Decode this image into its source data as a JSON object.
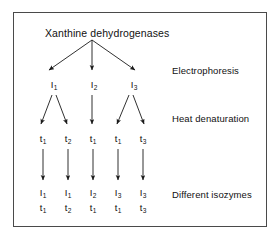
{
  "figure": {
    "title": "Xanthine dehydrogenases",
    "border_color": "#4a4a4a",
    "background_color": "#ffffff",
    "text_color": "#111111",
    "arrow_color": "#1a1a1a"
  },
  "stages": [
    {
      "id": "electrophoresis",
      "label": "Electrophoresis"
    },
    {
      "id": "heat-denaturation",
      "label": "Heat denaturation"
    },
    {
      "id": "different-isozymes",
      "label": "Different isozymes"
    }
  ],
  "levels": {
    "electrophoresis_products": [
      {
        "symbol": "I",
        "subscript": "1"
      },
      {
        "symbol": "I",
        "subscript": "2"
      },
      {
        "symbol": "I",
        "subscript": "3"
      }
    ],
    "heat_denaturation_products": [
      {
        "symbol": "t",
        "subscript": "1"
      },
      {
        "symbol": "t",
        "subscript": "2"
      },
      {
        "symbol": "t",
        "subscript": "1"
      },
      {
        "symbol": "t",
        "subscript": "1"
      },
      {
        "symbol": "t",
        "subscript": "3"
      }
    ],
    "isozymes_top": [
      {
        "symbol": "I",
        "subscript": "1"
      },
      {
        "symbol": "I",
        "subscript": "1"
      },
      {
        "symbol": "I",
        "subscript": "2"
      },
      {
        "symbol": "I",
        "subscript": "3"
      },
      {
        "symbol": "I",
        "subscript": "3"
      }
    ],
    "isozymes_bottom": [
      {
        "symbol": "t",
        "subscript": "1"
      },
      {
        "symbol": "t",
        "subscript": "2"
      },
      {
        "symbol": "t",
        "subscript": "1"
      },
      {
        "symbol": "t",
        "subscript": "1"
      },
      {
        "symbol": "t",
        "subscript": "3"
      }
    ]
  }
}
